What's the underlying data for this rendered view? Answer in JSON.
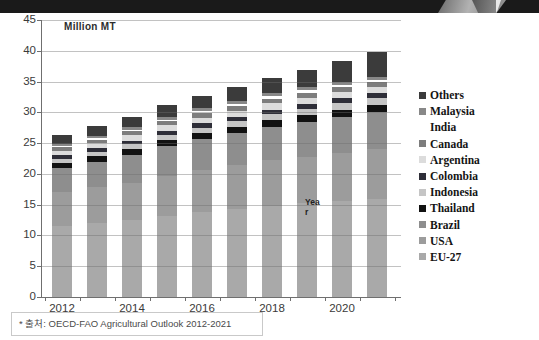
{
  "page": {
    "top_band_color": "#1a1a1a",
    "background": "#ffffff",
    "gridline_color": "#9e9e9e",
    "axis_color": "#6f6f6f",
    "text_color": "#3a3a3a"
  },
  "chart_data": {
    "type": "bar",
    "stacked": true,
    "title": "Million MT",
    "ylabel": "Million MT",
    "xlabel": "Year",
    "categories": [
      2012,
      2013,
      2014,
      2015,
      2016,
      2017,
      2018,
      2019,
      2020,
      2021
    ],
    "x_tick_labels": [
      "2012",
      "2014",
      "2016",
      "2018",
      "2020"
    ],
    "ylim": [
      0,
      45
    ],
    "yticks": [
      0,
      5,
      10,
      15,
      20,
      25,
      30,
      35,
      40,
      45
    ],
    "grid": true,
    "legend_position": "right",
    "legend_order_top_to_bottom": [
      "Others",
      "Malaysia",
      "India",
      "Canada",
      "Argentina",
      "Colombia",
      "Indonesia",
      "Thailand",
      "Brazil",
      "USA",
      "EU-27"
    ],
    "series": [
      {
        "name": "EU-27",
        "color": "#a9a9a9",
        "values": [
          11.5,
          12.0,
          12.5,
          13.2,
          13.8,
          14.3,
          14.8,
          15.2,
          15.6,
          16.0
        ]
      },
      {
        "name": "USA",
        "color": "#9c9c9c",
        "values": [
          5.5,
          5.8,
          6.1,
          6.5,
          6.8,
          7.1,
          7.4,
          7.6,
          7.8,
          8.0
        ]
      },
      {
        "name": "Brazil",
        "color": "#8e8e8e",
        "values": [
          4.0,
          4.2,
          4.5,
          4.8,
          5.0,
          5.2,
          5.4,
          5.6,
          5.8,
          6.0
        ]
      },
      {
        "name": "Thailand",
        "color": "#121212",
        "values": [
          0.8,
          0.85,
          0.9,
          0.95,
          1.0,
          1.05,
          1.1,
          1.15,
          1.2,
          1.2
        ]
      },
      {
        "name": "Indonesia",
        "color": "#c5c5c5",
        "values": [
          0.7,
          0.75,
          0.8,
          0.85,
          0.9,
          0.95,
          1.0,
          1.05,
          1.1,
          1.1
        ]
      },
      {
        "name": "Colombia",
        "color": "#2e2e38",
        "values": [
          0.5,
          0.55,
          0.6,
          0.65,
          0.7,
          0.72,
          0.75,
          0.78,
          0.8,
          0.8
        ]
      },
      {
        "name": "Argentina",
        "color": "#dcdcdc",
        "values": [
          0.8,
          0.85,
          0.9,
          0.92,
          0.95,
          0.97,
          1.0,
          1.0,
          1.0,
          1.0
        ]
      },
      {
        "name": "Canada",
        "color": "#7d7d7d",
        "values": [
          0.5,
          0.55,
          0.6,
          0.65,
          0.7,
          0.72,
          0.75,
          0.78,
          0.8,
          0.8
        ]
      },
      {
        "name": "India",
        "color": "#ffffff",
        "values": [
          0.2,
          0.25,
          0.3,
          0.32,
          0.35,
          0.37,
          0.4,
          0.4,
          0.4,
          0.4
        ]
      },
      {
        "name": "Malaysia",
        "color": "#888888",
        "values": [
          0.3,
          0.35,
          0.4,
          0.42,
          0.45,
          0.47,
          0.5,
          0.5,
          0.5,
          0.5
        ]
      },
      {
        "name": "Others",
        "color": "#3b3b3b",
        "values": [
          1.5,
          1.6,
          1.7,
          1.9,
          2.0,
          2.2,
          2.5,
          2.9,
          3.3,
          4.0
        ]
      }
    ]
  },
  "annotations": {
    "year_line1": "Yea",
    "year_line2": "r"
  },
  "footnote": {
    "text": "* 출처: OECD-FAO Agricultural Outlook 2012-2021"
  }
}
